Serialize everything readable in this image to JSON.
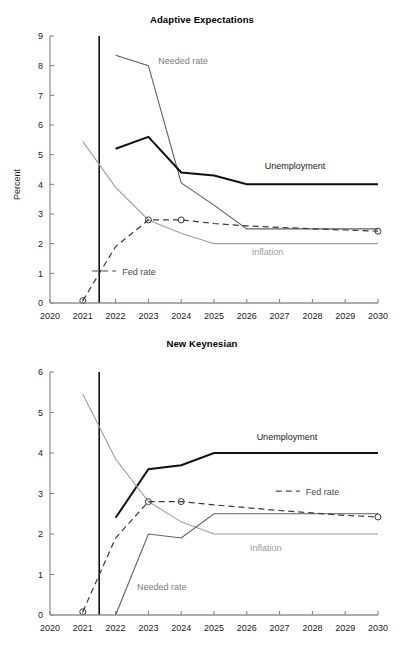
{
  "figure": {
    "ylabel": "Percent",
    "x_tick_labels": [
      "2020",
      "2021",
      "2022",
      "2023",
      "2024",
      "2025",
      "2026",
      "2027",
      "2028",
      "2029",
      "2030"
    ],
    "colors": {
      "unemployment": "#111111",
      "fed_rate": "#3a3a3a",
      "needed_rate": "#5f5f5f",
      "inflation": "#9c9c9c",
      "axis": "#7a7a7a",
      "vline": "#111111"
    }
  },
  "chart_data": [
    {
      "type": "line",
      "title": "Adaptive Expectations",
      "xlabel": "",
      "ylabel": "Percent",
      "xlim": [
        2020,
        2030
      ],
      "ylim": [
        0,
        9
      ],
      "x_ticks": [
        2020,
        2021,
        2022,
        2023,
        2024,
        2025,
        2026,
        2027,
        2028,
        2029,
        2030
      ],
      "y_ticks": [
        0,
        1,
        2,
        3,
        4,
        5,
        6,
        7,
        8,
        9
      ],
      "grid": false,
      "legend": "inline-annotations",
      "annotations": [
        {
          "label": "Needed rate",
          "x": 2023.3,
          "y": 8.05
        },
        {
          "label": "Unemployment",
          "x": 2026.55,
          "y": 4.52
        },
        {
          "label": "Inflation",
          "x": 2026.15,
          "y": 1.62
        },
        {
          "label": "Fed rate",
          "x": 2022.2,
          "y": 0.96
        }
      ],
      "vertical_reference_line": 2021.5,
      "series": [
        {
          "name": "Needed rate",
          "color": "#5f5f5f",
          "style": "solid",
          "x": [
            2022,
            2023,
            2024,
            2025,
            2026,
            2027,
            2028,
            2029,
            2030
          ],
          "values": [
            8.35,
            8.0,
            4.05,
            3.3,
            2.5,
            2.5,
            2.5,
            2.5,
            2.5
          ]
        },
        {
          "name": "Unemployment",
          "color": "#111111",
          "style": "solid",
          "x": [
            2022,
            2023,
            2024,
            2025,
            2026,
            2027,
            2028,
            2029,
            2030
          ],
          "values": [
            5.2,
            5.6,
            4.4,
            4.3,
            4.0,
            4.0,
            4.0,
            4.0,
            4.0
          ]
        },
        {
          "name": "Inflation",
          "color": "#9c9c9c",
          "style": "solid",
          "x": [
            2021,
            2022,
            2023,
            2024,
            2025,
            2026,
            2027,
            2028,
            2029,
            2030
          ],
          "values": [
            5.45,
            3.9,
            2.8,
            2.35,
            2.0,
            2.0,
            2.0,
            2.0,
            2.0,
            2.0
          ]
        },
        {
          "name": "Fed rate",
          "color": "#3a3a3a",
          "style": "dashed",
          "markers": true,
          "x": [
            2021,
            2022,
            2023,
            2024,
            2025,
            2026,
            2027,
            2028,
            2029,
            2030
          ],
          "values": [
            0.08,
            1.9,
            2.8,
            2.8,
            2.68,
            2.6,
            2.55,
            2.5,
            2.46,
            2.42
          ]
        },
        {
          "name": "Zero line",
          "color": "#9c9c9c",
          "style": "solid",
          "x": [
            2020,
            2030
          ],
          "values": [
            0,
            0
          ]
        }
      ]
    },
    {
      "type": "line",
      "title": "New Keynesian",
      "xlabel": "",
      "ylabel": "Percent",
      "xlim": [
        2020,
        2030
      ],
      "ylim": [
        0,
        6
      ],
      "x_ticks": [
        2020,
        2021,
        2022,
        2023,
        2024,
        2025,
        2026,
        2027,
        2028,
        2029,
        2030
      ],
      "y_ticks": [
        0,
        1,
        2,
        3,
        4,
        5,
        6
      ],
      "grid": false,
      "legend": "inline-annotations",
      "annotations": [
        {
          "label": "Unemployment",
          "x": 2026.3,
          "y": 4.32
        },
        {
          "label": "Fed rate",
          "x": 2027.8,
          "y": 2.97
        },
        {
          "label": "Inflation",
          "x": 2026.1,
          "y": 1.57
        },
        {
          "label": "Needed rate",
          "x": 2022.65,
          "y": 0.62
        }
      ],
      "vertical_reference_line": 2021.5,
      "series": [
        {
          "name": "Unemployment",
          "color": "#111111",
          "style": "solid",
          "x": [
            2022,
            2023,
            2024,
            2025,
            2026,
            2027,
            2028,
            2029,
            2030
          ],
          "values": [
            2.4,
            3.6,
            3.7,
            4.0,
            4.0,
            4.0,
            4.0,
            4.0,
            4.0
          ]
        },
        {
          "name": "Inflation",
          "color": "#9c9c9c",
          "style": "solid",
          "x": [
            2021,
            2022,
            2023,
            2024,
            2025,
            2026,
            2027,
            2028,
            2029,
            2030
          ],
          "values": [
            5.45,
            3.85,
            2.8,
            2.3,
            2.0,
            2.0,
            2.0,
            2.0,
            2.0,
            2.0
          ]
        },
        {
          "name": "Needed rate",
          "color": "#5f5f5f",
          "style": "solid",
          "x": [
            2022,
            2023,
            2024,
            2025,
            2026,
            2027,
            2028,
            2029,
            2030
          ],
          "values": [
            0.0,
            2.0,
            1.9,
            2.5,
            2.5,
            2.5,
            2.5,
            2.5,
            2.5
          ]
        },
        {
          "name": "Fed rate",
          "color": "#3a3a3a",
          "style": "dashed",
          "markers": true,
          "x": [
            2021,
            2022,
            2023,
            2024,
            2025,
            2026,
            2027,
            2028,
            2029,
            2030
          ],
          "values": [
            0.08,
            1.9,
            2.8,
            2.8,
            2.72,
            2.65,
            2.58,
            2.52,
            2.46,
            2.42
          ]
        },
        {
          "name": "Zero line",
          "color": "#9c9c9c",
          "style": "solid",
          "x": [
            2020,
            2030
          ],
          "values": [
            0,
            0
          ]
        }
      ]
    }
  ]
}
